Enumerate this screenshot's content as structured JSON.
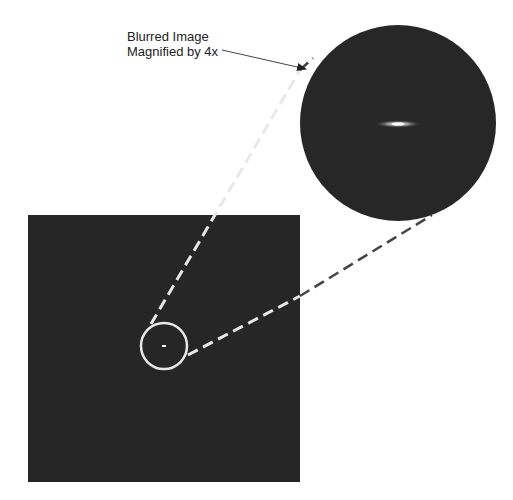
{
  "annotation": {
    "line1": "Blurred Image",
    "line2": "Magnified by 4x"
  },
  "colors": {
    "background": "#ffffff",
    "image_fill": "#262626",
    "circle_stroke": "#e8e8e8",
    "dash_stroke": "#e8e8e8",
    "arrow": "#222222",
    "point": "#f2f2f2"
  },
  "geometry": {
    "main_image": {
      "x": 28,
      "y": 215,
      "width": 272,
      "height": 267
    },
    "small_circle": {
      "cx": 164,
      "cy": 346,
      "r": 25
    },
    "magnified_circle": {
      "cx": 398,
      "cy": 123,
      "r": 98
    },
    "magnification": "4x"
  }
}
